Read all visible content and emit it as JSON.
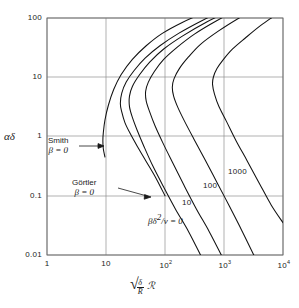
{
  "chart_data": {
    "type": "line",
    "title": "",
    "xlabel": "sqrt(delta/R) * Script-R",
    "ylabel": "alpha*delta",
    "xscale": "log",
    "yscale": "log",
    "xlim": [
      1,
      10000
    ],
    "ylim": [
      0.01,
      100
    ],
    "grid": true,
    "legend_position": "inline-curve-labels",
    "xticks": [
      "1",
      "10",
      "10²",
      "10³",
      "10⁴"
    ],
    "xtick_values": [
      1,
      10,
      100,
      1000,
      10000
    ],
    "yticks": [
      "100",
      "10",
      "1",
      "0.1",
      "0.01"
    ],
    "ytick_values": [
      100,
      10,
      1,
      0.1,
      0.01
    ],
    "series": [
      {
        "name": "Smith beta=0",
        "label": "Smith",
        "points": [
          [
            9.6,
            0.45
          ],
          [
            9.0,
            0.62
          ],
          [
            8.85,
            0.85
          ],
          [
            9.0,
            1.15
          ],
          [
            9.6,
            1.9
          ],
          [
            11.0,
            3.4
          ],
          [
            13.5,
            6.2
          ],
          [
            18,
            11
          ],
          [
            28,
            20
          ],
          [
            48,
            34
          ],
          [
            90,
            55
          ],
          [
            200,
            85
          ],
          [
            520,
            130
          ],
          [
            1500,
            210
          ],
          [
            4200,
            330
          ],
          [
            10000,
            500
          ]
        ]
      },
      {
        "name": "Goertler beta=0",
        "label": "Görtler",
        "points": [
          [
            100,
            0.1
          ],
          [
            70,
            0.2
          ],
          [
            48,
            0.38
          ],
          [
            34,
            0.68
          ],
          [
            26,
            1.1
          ],
          [
            21,
            1.7
          ],
          [
            18.5,
            2.6
          ],
          [
            17.5,
            3.6
          ],
          [
            18.5,
            5.4
          ],
          [
            22,
            8.3
          ],
          [
            30,
            13
          ],
          [
            46,
            21
          ],
          [
            82,
            34
          ],
          [
            170,
            55
          ],
          [
            420,
            90
          ],
          [
            1200,
            150
          ],
          [
            3600,
            250
          ],
          [
            10000,
            420
          ]
        ]
      },
      {
        "name": "beta*delta^2/nu = 0",
        "label": "βδ²/ν = 0",
        "points": [
          [
            400,
            0.01
          ],
          [
            250,
            0.025
          ],
          [
            150,
            0.06
          ],
          [
            95,
            0.14
          ],
          [
            62,
            0.32
          ],
          [
            44,
            0.68
          ],
          [
            34,
            1.25
          ],
          [
            28,
            2.1
          ],
          [
            25,
            3.2
          ],
          [
            25,
            4.8
          ],
          [
            28,
            7.0
          ],
          [
            37,
            11
          ],
          [
            55,
            18
          ],
          [
            95,
            30
          ],
          [
            200,
            50
          ],
          [
            500,
            85
          ],
          [
            1400,
            140
          ],
          [
            4000,
            235
          ],
          [
            10000,
            390
          ]
        ]
      },
      {
        "name": "10",
        "label": "10",
        "points": [
          [
            900,
            0.01
          ],
          [
            560,
            0.025
          ],
          [
            340,
            0.06
          ],
          [
            210,
            0.15
          ],
          [
            135,
            0.36
          ],
          [
            92,
            0.78
          ],
          [
            68,
            1.5
          ],
          [
            55,
            2.6
          ],
          [
            48,
            4.0
          ],
          [
            47,
            5.8
          ],
          [
            52,
            8.2
          ],
          [
            66,
            12.5
          ],
          [
            95,
            20
          ],
          [
            160,
            32
          ],
          [
            320,
            54
          ],
          [
            750,
            90
          ],
          [
            2000,
            150
          ],
          [
            5600,
            250
          ],
          [
            10000,
            340
          ]
        ]
      },
      {
        "name": "100",
        "label": "100",
        "points": [
          [
            3200,
            0.01
          ],
          [
            2000,
            0.026
          ],
          [
            1250,
            0.065
          ],
          [
            780,
            0.16
          ],
          [
            480,
            0.4
          ],
          [
            310,
            0.9
          ],
          [
            215,
            1.8
          ],
          [
            165,
            3.1
          ],
          [
            140,
            4.8
          ],
          [
            133,
            6.8
          ],
          [
            142,
            9.4
          ],
          [
            175,
            14
          ],
          [
            250,
            22
          ],
          [
            400,
            36
          ],
          [
            800,
            60
          ],
          [
            1800,
            100
          ],
          [
            4600,
            170
          ],
          [
            10000,
            260
          ]
        ]
      },
      {
        "name": "1000",
        "label": "1000",
        "points": [
          [
            10000,
            0.035
          ],
          [
            6300,
            0.07
          ],
          [
            4000,
            0.16
          ],
          [
            2500,
            0.38
          ],
          [
            1600,
            0.85
          ],
          [
            1100,
            1.8
          ],
          [
            820,
            3.2
          ],
          [
            690,
            5.2
          ],
          [
            640,
            7.5
          ],
          [
            660,
            10
          ],
          [
            760,
            14
          ],
          [
            980,
            20
          ],
          [
            1400,
            30
          ],
          [
            2300,
            46
          ],
          [
            4200,
            75
          ],
          [
            8200,
            120
          ],
          [
            10000,
            145
          ]
        ]
      }
    ],
    "annotations": [
      {
        "id": "smith",
        "text_line1": "Smith",
        "text_line2": "β = 0",
        "arrow": "right"
      },
      {
        "id": "goertler",
        "text_line1": "Görtler",
        "text_line2": "β = 0",
        "arrow": "down-right"
      },
      {
        "id": "beta-zero",
        "text": "βδ²/ν = 0",
        "arrow": "none"
      }
    ],
    "curve_labels": [
      {
        "text": "1000",
        "x": 2300,
        "y": 0.44
      },
      {
        "text": "100",
        "x": 1150,
        "y": 0.24
      },
      {
        "text": "10",
        "x": 640,
        "y": 0.082
      }
    ]
  },
  "axes": {
    "y_title": "αδ",
    "y_title_parts": {
      "alpha": "α",
      "delta": "δ"
    },
    "x_title_parts": {
      "numerator": "δ",
      "denominator": "R",
      "factor": "ℛ",
      "radical": "√"
    },
    "ytick_labels": [
      "100",
      "10",
      "1",
      "0.1",
      "0.01"
    ],
    "xtick_labels": [
      "1",
      "10",
      "10",
      "10",
      "10"
    ],
    "xtick_exponents": [
      "",
      "",
      "2",
      "3",
      "4"
    ]
  },
  "annotations": {
    "smith_name": "Smith",
    "smith_beta": "β = 0",
    "goertler_name": "Görtler",
    "goertler_beta": "β = 0",
    "beta_param_beta": "βδ",
    "beta_param_exp": "2",
    "beta_param_rest": "/ν = 0",
    "label_1000": "1000",
    "label_100": "100",
    "label_10": "10"
  },
  "colors": {
    "curve": "#111111",
    "grid": "#8a8a8a",
    "axis": "#4a4a4a",
    "text": "#1a1a1a",
    "background": "#ffffff"
  }
}
